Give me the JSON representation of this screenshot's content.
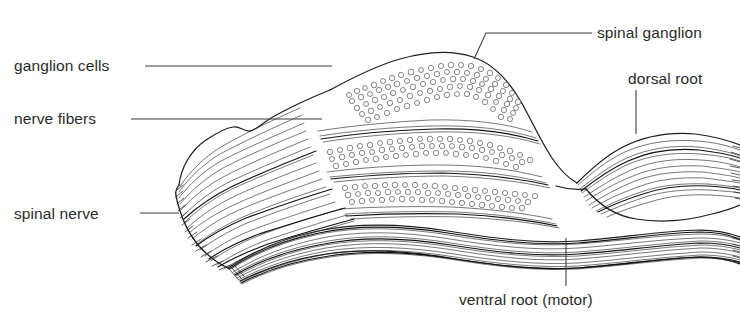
{
  "figure": {
    "background_color": "#ffffff",
    "ink_color": "#1d1d1d",
    "text_color": "#2b2b2b",
    "width": 740,
    "height": 325
  },
  "labels": {
    "ganglion_cells": "ganglion cells",
    "nerve_fibers": "nerve fibers",
    "spinal_nerve": "spinal nerve",
    "spinal_ganglion": "spinal ganglion",
    "dorsal_root": "dorsal root",
    "ventral_root": "ventral root (motor)"
  },
  "label_positions": {
    "ganglion_cells": {
      "x": 14,
      "y": 71,
      "anchor": "start"
    },
    "nerve_fibers": {
      "x": 14,
      "y": 124,
      "anchor": "start"
    },
    "spinal_nerve": {
      "x": 14,
      "y": 219,
      "anchor": "start"
    },
    "spinal_ganglion": {
      "x": 597,
      "y": 38,
      "anchor": "start"
    },
    "dorsal_root": {
      "x": 628,
      "y": 84,
      "anchor": "start"
    },
    "ventral_root": {
      "x": 459,
      "y": 305,
      "anchor": "start"
    }
  },
  "leader_lines": {
    "ganglion_cells": "M145,66 L332,66",
    "nerve_fibers": "M131,119 L322,119",
    "spinal_nerve": "M140,213 L179,213",
    "spinal_ganglion": "M474,59 L486,33 L592,33",
    "dorsal_root": "M636,90 L636,134",
    "ventral_root": "M566,238 L566,286"
  },
  "parts": [
    {
      "name": "spinal-nerve-trunk",
      "description": "cut proximal trunk of mixed spinal nerve, left side"
    },
    {
      "name": "spinal-ganglion",
      "description": "dorsal root ganglion, fusiform swelling containing cell bodies"
    },
    {
      "name": "ganglion-cell-bands",
      "description": "stippled clusters of ganglion cell bodies"
    },
    {
      "name": "nerve-fiber-bands",
      "description": "parallel longitudinal nerve fiber bundles"
    },
    {
      "name": "dorsal-root",
      "description": "sensory dorsal root leaving ganglion toward right"
    },
    {
      "name": "ventral-root",
      "description": "motor ventral root running below, toward right"
    }
  ]
}
